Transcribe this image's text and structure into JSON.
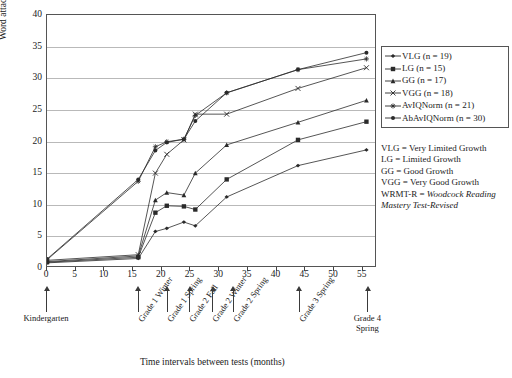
{
  "chart_data": {
    "type": "line",
    "title": "",
    "xlabel": "Time intervals between tests (months)",
    "ylabel": "Word attack raw score on WRMT-R",
    "ylabel_plain": "Word attack raw score on ",
    "ylabel_italic": "WRMT-R",
    "xlim": [
      0,
      57.5
    ],
    "ylim": [
      0,
      40
    ],
    "yticks": [
      0,
      5,
      10,
      15,
      20,
      25,
      30,
      35,
      40
    ],
    "xticks": [
      0,
      5,
      10,
      15,
      20,
      25,
      30,
      35,
      40,
      45,
      50,
      55
    ],
    "grid": true,
    "legend_position": "right",
    "x": [
      0,
      16,
      19,
      21,
      24,
      26,
      31.5,
      44,
      56
    ],
    "category_labels": [
      {
        "label": "Kindergarten",
        "x": 0,
        "rotated": false
      },
      {
        "label": "Grade 1 Winter",
        "x": 16,
        "rotated": true
      },
      {
        "label": "Grade 1 Spring",
        "x": 21,
        "rotated": true
      },
      {
        "label": "Grade 2 Fall",
        "x": 25,
        "rotated": true
      },
      {
        "label": "Grade 2 Winter",
        "x": 29,
        "rotated": true
      },
      {
        "label": "Grade 2 Spring",
        "x": 32.5,
        "rotated": true
      },
      {
        "label": "Grade 3 Spring",
        "x": 44,
        "rotated": true
      },
      {
        "label": "Grade 4\nSpring",
        "x": 56,
        "rotated": false
      }
    ],
    "series": [
      {
        "name": "VLG (n = 19)",
        "key": "VLG",
        "marker": "diamond",
        "values": [
          0.5,
          1.2,
          5.5,
          6.0,
          7.0,
          6.4,
          11.0,
          16.0,
          18.5
        ]
      },
      {
        "name": "LG (n = 15)",
        "key": "LG",
        "marker": "square",
        "values": [
          0.6,
          1.4,
          8.5,
          9.6,
          9.5,
          9.0,
          13.8,
          20.1,
          23.0
        ]
      },
      {
        "name": "GG (n = 17)",
        "key": "GG",
        "marker": "triangle",
        "values": [
          0.7,
          1.6,
          10.5,
          11.7,
          11.3,
          14.8,
          19.3,
          22.9,
          26.4
        ]
      },
      {
        "name": "VGG (n = 18)",
        "key": "VGG",
        "marker": "cross",
        "values": [
          0.9,
          1.8,
          14.8,
          17.8,
          20.1,
          24.2,
          24.2,
          28.3,
          31.6
        ]
      },
      {
        "name": "AvIQNorm (n = 21)",
        "key": "AvIQNorm",
        "marker": "star",
        "values": [
          1.0,
          13.5,
          19.0,
          19.8,
          20.2,
          24.0,
          27.6,
          31.3,
          33.0
        ]
      },
      {
        "name": "AbAvIQNorm (n = 30)",
        "key": "AbAvIQNorm",
        "marker": "circle",
        "values": [
          1.1,
          13.8,
          18.4,
          19.7,
          20.2,
          23.1,
          27.6,
          31.3,
          34.0
        ]
      }
    ],
    "notes": [
      {
        "text": "VLG = Very Limited Growth",
        "italic_from": null
      },
      {
        "text": "LG = Limited Growth",
        "italic_from": null
      },
      {
        "text": "GG = Good Growth",
        "italic_from": null
      },
      {
        "text": "VGG = Very Good Growth",
        "italic_from": null
      }
    ],
    "note_wrmt_prefix": "WRMT-R = ",
    "note_wrmt_italic": "Woodcock Reading Mastery Test-Revised"
  },
  "colors": {
    "line": "#2a2a2a",
    "grid": "#b9b9b9",
    "frame": "#555555",
    "text": "#1a1a1a"
  }
}
